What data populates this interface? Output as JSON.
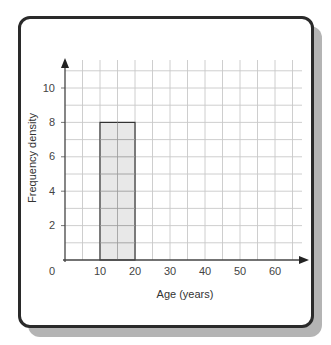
{
  "chart_data": {
    "type": "bar",
    "subtype": "histogram",
    "title": "",
    "xlabel": "Age (years)",
    "ylabel": "Frequency density",
    "x_ticks": [
      0,
      10,
      20,
      30,
      40,
      50,
      60
    ],
    "y_ticks": [
      2,
      4,
      6,
      8,
      10
    ],
    "xlim": [
      0,
      68
    ],
    "ylim": [
      0,
      11
    ],
    "grid": true,
    "grid_minor_x": 5,
    "grid_minor_y": 1,
    "bars": [
      {
        "x_start": 10,
        "x_end": 20,
        "height": 8
      }
    ],
    "bar_fill": "#e4e4e4",
    "bar_edge": "#333333"
  },
  "labels": {
    "xlabel": "Age (years)",
    "ylabel": "Frequency density",
    "origin": "0",
    "x_ticks": [
      "10",
      "20",
      "30",
      "40",
      "50",
      "60"
    ],
    "y_ticks": [
      "2",
      "4",
      "6",
      "8",
      "10"
    ]
  }
}
